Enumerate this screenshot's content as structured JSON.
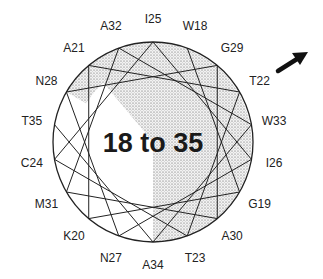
{
  "diagram": {
    "type": "helical-wheel",
    "center_label": "18 to 35",
    "residues_clockwise_from_top": [
      {
        "label": "I25",
        "angle": 0
      },
      {
        "label": "W18",
        "angle": 20
      },
      {
        "label": "G29",
        "angle": 40
      },
      {
        "label": "T22",
        "angle": 60
      },
      {
        "label": "W33",
        "angle": 80
      },
      {
        "label": "I26",
        "angle": 100
      },
      {
        "label": "G19",
        "angle": 120
      },
      {
        "label": "A30",
        "angle": 140
      },
      {
        "label": "T23",
        "angle": 160
      },
      {
        "label": "A34",
        "angle": 180
      },
      {
        "label": "N27",
        "angle": 200
      },
      {
        "label": "K20",
        "angle": 220
      },
      {
        "label": "M31",
        "angle": 240
      },
      {
        "label": "C24",
        "angle": 260
      },
      {
        "label": "T35",
        "angle": 280
      },
      {
        "label": "N28",
        "angle": 300
      },
      {
        "label": "A21",
        "angle": 320
      },
      {
        "label": "A32",
        "angle": 340
      }
    ],
    "sequence_order": [
      "W18",
      "G19",
      "K20",
      "A21",
      "T22",
      "T23",
      "C24",
      "I25",
      "I26",
      "N27",
      "N28",
      "G29",
      "A30",
      "M31",
      "A32",
      "W33",
      "A34",
      "T35"
    ],
    "shaded_sector": {
      "from_angle": 320,
      "to_angle": 180,
      "fill": "stippled"
    },
    "arrow": {
      "direction": "up-right",
      "color": "#111111"
    }
  }
}
